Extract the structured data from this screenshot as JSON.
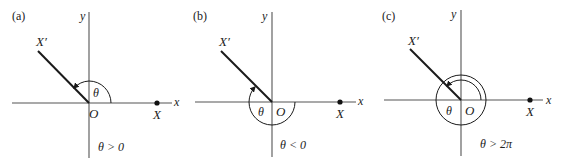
{
  "figure": {
    "panels": [
      {
        "label": "(a)",
        "x_axis_label": "x",
        "y_axis_label": "y",
        "origin_label": "O",
        "point_label": "X",
        "ray_label": "X′",
        "angle_label": "θ",
        "condition": "θ > 0"
      },
      {
        "label": "(b)",
        "x_axis_label": "x",
        "y_axis_label": "y",
        "origin_label": "O",
        "point_label": "X",
        "ray_label": "X′",
        "angle_label": "θ",
        "condition": "θ < 0"
      },
      {
        "label": "(c)",
        "x_axis_label": "x",
        "y_axis_label": "y",
        "origin_label": "O",
        "point_label": "X",
        "ray_label": "X′",
        "angle_label": "θ",
        "condition": "θ > 2π"
      }
    ]
  }
}
